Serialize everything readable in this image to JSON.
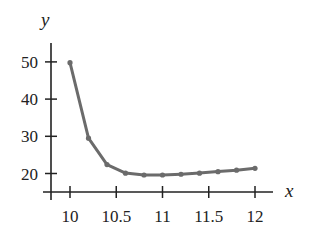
{
  "chart_data": {
    "type": "line",
    "title": "",
    "xlabel": "x",
    "ylabel": "y",
    "x": [
      10.0,
      10.2,
      10.4,
      10.6,
      10.8,
      11.0,
      11.2,
      11.4,
      11.6,
      11.8,
      12.0
    ],
    "series": [
      {
        "name": "y",
        "values": [
          49.8,
          29.5,
          22.4,
          20.1,
          19.6,
          19.6,
          19.8,
          20.1,
          20.5,
          20.9,
          21.4
        ],
        "color": "#6b6b6b"
      }
    ],
    "xticks": [
      10,
      10.5,
      11,
      11.5,
      12
    ],
    "xtick_labels": [
      "10",
      "10.5",
      "11",
      "11.5",
      "12"
    ],
    "yticks": [
      20,
      30,
      40,
      50
    ],
    "ytick_labels": [
      "20",
      "30",
      "40",
      "50"
    ],
    "xlim": [
      9.75,
      12.2
    ],
    "ylim": [
      15,
      55
    ],
    "grid": false,
    "legend": null,
    "markers": true
  },
  "colors": {
    "line": "#6b6b6b",
    "axis": "#222222",
    "background": "#ffffff"
  }
}
